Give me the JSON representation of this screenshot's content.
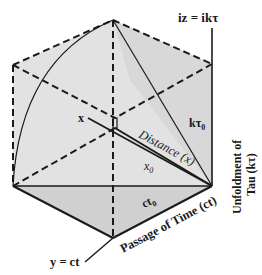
{
  "diagram": {
    "type": "cube-projection",
    "colors": {
      "face_light": "#e4e4e4",
      "face_mid": "#d6d6d6",
      "face_dark": "#cbcbcb",
      "line": "#1a1a1a",
      "background": "#ffffff"
    },
    "labels": {
      "top_axis": "iz = ikτ",
      "right_axis_line1": "Unfoldment of",
      "right_axis_line2": "Tau (kτ)",
      "bottom_axis": "Passage of Time (ct)",
      "bottom_left_axis": "y = ct",
      "x_axis": "x",
      "distance": "Distance (x)",
      "k_tau_0": "kτ",
      "k_tau_0_sub": "0",
      "x_0": "x",
      "x_0_sub": "0",
      "ct_0": "ct",
      "ct_0_sub": "0"
    }
  }
}
